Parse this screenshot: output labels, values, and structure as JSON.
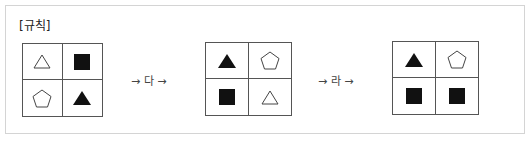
{
  "title": "[규칙]",
  "transforms": [
    {
      "label": "→ 다 →"
    },
    {
      "label": "→ 라 →"
    }
  ],
  "grids": [
    {
      "name": "initial",
      "cells": [
        "outline-triangle",
        "filled-square",
        "outline-pentagon",
        "filled-triangle"
      ]
    },
    {
      "name": "after-da",
      "cells": [
        "filled-triangle",
        "outline-pentagon",
        "filled-square",
        "outline-triangle"
      ]
    },
    {
      "name": "after-ra",
      "cells": [
        "filled-triangle",
        "outline-pentagon",
        "filled-square",
        "filled-square"
      ]
    }
  ],
  "colors": {
    "fill": "#111111",
    "stroke": "#555555",
    "frame": "#d4d4d4"
  }
}
